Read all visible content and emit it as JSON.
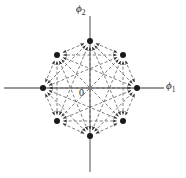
{
  "figure": {
    "name": "signal-constellation-diagram",
    "origin_label": "0",
    "axes": {
      "horizontal": {
        "name": "phi1-axis",
        "label_text": "ϕ",
        "label_subscript": "1",
        "y": 88,
        "x_start": 4,
        "x_end": 164,
        "color": "#777777"
      },
      "vertical": {
        "name": "phi2-axis",
        "label_text": "ϕ",
        "label_subscript": "2",
        "x": 90,
        "y_start": 16,
        "y_end": 172,
        "color": "#777777"
      }
    },
    "style": {
      "background": "#ffffff",
      "node_color": "#1a1a1a",
      "edge_color": "#5a5a5a",
      "edge_dash": "3,2.2",
      "edge_width": 0.8,
      "node_radius": 3.0,
      "arrow_color": "#2b2b2b"
    }
  },
  "chart_data": {
    "type": "scatter",
    "title": "",
    "xlabel": "ϕ1",
    "ylabel": "ϕ2",
    "grid": false,
    "legend": false,
    "constellation": "8-PSK",
    "point_count": 8,
    "radius_px": 47,
    "center": {
      "x": 90,
      "y": 88
    },
    "categories": [
      "s1",
      "s2",
      "s3",
      "s4",
      "s5",
      "s6",
      "s7",
      "s8"
    ],
    "angles_deg": [
      0,
      45,
      90,
      135,
      180,
      225,
      270,
      315
    ],
    "points": [
      {
        "name": "s1",
        "angle_deg": 0,
        "x": 137,
        "y": 88
      },
      {
        "name": "s2",
        "angle_deg": 45,
        "x": 123,
        "y": 55
      },
      {
        "name": "s3",
        "angle_deg": 90,
        "x": 90,
        "y": 41
      },
      {
        "name": "s4",
        "angle_deg": 135,
        "x": 57,
        "y": 55
      },
      {
        "name": "s5",
        "angle_deg": 180,
        "x": 43,
        "y": 88
      },
      {
        "name": "s6",
        "angle_deg": 225,
        "x": 57,
        "y": 121
      },
      {
        "name": "s7",
        "angle_deg": 270,
        "x": 90,
        "y": 136
      },
      {
        "name": "s8",
        "angle_deg": 315,
        "x": 123,
        "y": 121
      }
    ],
    "edges_description": "dashed double-headed arrows between every pair of constellation points"
  }
}
